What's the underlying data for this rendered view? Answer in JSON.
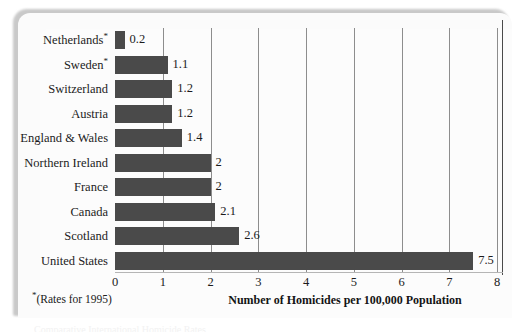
{
  "chart_data": {
    "type": "bar",
    "orientation": "horizontal",
    "title": "",
    "xlabel": "Number of Homicides per 100,000 Population",
    "ylabel": "",
    "xlim": [
      0,
      8
    ],
    "xticks": [
      0,
      1,
      2,
      3,
      4,
      5,
      6,
      7,
      8
    ],
    "xtick_labels": [
      "0",
      "1",
      "2",
      "3",
      "4",
      "5",
      "6",
      "7",
      "8"
    ],
    "grid": true,
    "grid_axis": "x",
    "legend": false,
    "bar_color": "#4a4a4a",
    "categories": [
      "Netherlands",
      "Sweden",
      "Switzerland",
      "Austria",
      "England & Wales",
      "Northern Ireland",
      "France",
      "Canada",
      "Scotland",
      "United States"
    ],
    "category_marks": [
      "*",
      "*",
      "",
      "",
      "",
      "",
      "",
      "",
      "",
      ""
    ],
    "values": [
      0.2,
      1.1,
      1.2,
      1.2,
      1.4,
      2,
      2,
      2.1,
      2.6,
      7.5
    ],
    "value_labels": [
      "0.2",
      "1.1",
      "1.2",
      "1.2",
      "1.4",
      "2",
      "2",
      "2.1",
      "2.6",
      "7.5"
    ],
    "footnote": "(Rates for 1995)",
    "footnote_mark": "*"
  },
  "bottom_cut_text": "Comparative International Homicide Rates"
}
